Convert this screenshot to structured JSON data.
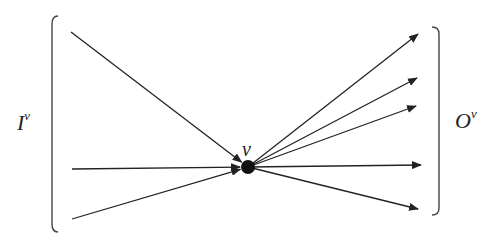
{
  "diagram": {
    "type": "node-in-out-edges",
    "node_label": "ν",
    "input_set_label": "I",
    "input_set_superscript": "ν",
    "output_set_label": "O",
    "output_set_superscript": "ν",
    "node": {
      "x": 248,
      "y": 167
    },
    "inputs": [
      {
        "from": [
          71,
          32
        ]
      },
      {
        "from": [
          72,
          169
        ]
      },
      {
        "from": [
          72,
          219
        ]
      }
    ],
    "outputs": [
      {
        "to": [
          418,
          34
        ]
      },
      {
        "to": [
          417,
          78
        ]
      },
      {
        "to": [
          416,
          106
        ]
      },
      {
        "to": [
          421,
          165
        ]
      },
      {
        "to": [
          418,
          209
        ]
      }
    ],
    "colors": {
      "ink": "#222222",
      "background": "#ffffff"
    }
  }
}
